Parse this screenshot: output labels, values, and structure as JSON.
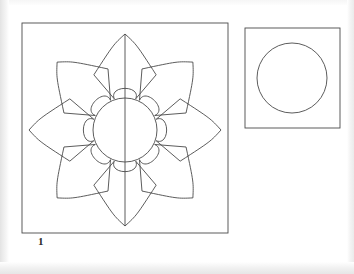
{
  "document": {
    "background_color": "#ffffff",
    "stroke_color": "#4a4a4a",
    "page_edge_shade_color": "#e3e3e3"
  },
  "figure": {
    "label": "1",
    "label_name": "figure-number-1"
  },
  "panels": [
    {
      "id": "left-panel",
      "name": "rosette-panel",
      "shape": "square",
      "x": 22,
      "y": 23,
      "width": 206,
      "height": 210,
      "contents": "eight-petal rosette with inscribed circle and vertical axis line"
    },
    {
      "id": "right-panel",
      "name": "circle-panel",
      "shape": "square",
      "x": 245,
      "y": 28,
      "width": 95,
      "height": 100,
      "contents": "single inscribed circle"
    }
  ],
  "rosette": {
    "center_x": 125,
    "center_y": 130,
    "inner_circle_radius": 32,
    "petal_count": 8,
    "petal_tip_radius": 96,
    "petal_base_radius": 33,
    "petal_half_angle_deg": 19,
    "petal_waist_bulge": 0.42,
    "axis_line": "vertical",
    "axis_from_y": 34,
    "axis_to_y": 226
  },
  "right_circle": {
    "center_x": 292,
    "center_y": 78,
    "radius": 35
  },
  "colors": {
    "ink": "#4a4a4a",
    "ink_dark": "#3a3a3a",
    "paper": "#ffffff"
  }
}
